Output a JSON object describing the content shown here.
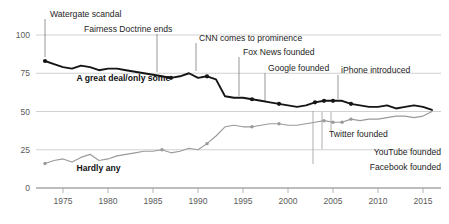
{
  "chart_data": {
    "type": "line",
    "title": "",
    "subtitle": "",
    "xlabel": "",
    "ylabel": "",
    "xlim": [
      1972,
      2017
    ],
    "ylim": [
      0,
      108
    ],
    "grid": true,
    "grid_axis": "y",
    "legend": "inline-series-labels",
    "yticks": [
      0,
      25,
      50,
      75,
      100
    ],
    "xticks": [
      1975,
      1980,
      1985,
      1990,
      1995,
      2000,
      2005,
      2010,
      2015
    ],
    "colors": {
      "series_1": "#151515",
      "series_2": "#9a9a9a",
      "grid": "#bdbdbd",
      "axis": "#6d6d6d",
      "text": "#1d1d1d"
    },
    "series": [
      {
        "name": "A great deal/only some",
        "color": "#151515",
        "label_x": 1976.5,
        "label_y": 70,
        "x": [
          1973,
          1974,
          1975,
          1976,
          1977,
          1978,
          1979,
          1980,
          1981,
          1982,
          1983,
          1984,
          1985,
          1986,
          1987,
          1988,
          1989,
          1990,
          1991,
          1992,
          1993,
          1994,
          1995,
          1996,
          1997,
          1998,
          1999,
          2000,
          2001,
          2002,
          2003,
          2004,
          2005,
          2006,
          2007,
          2008,
          2009,
          2010,
          2011,
          2012,
          2013,
          2014,
          2015,
          2016
        ],
        "values": [
          83,
          81,
          79,
          78,
          80,
          79,
          77,
          78,
          78,
          77,
          76,
          75,
          74,
          73,
          72,
          73,
          75,
          72,
          73,
          71,
          60,
          59,
          59,
          58,
          57,
          56,
          55,
          54,
          53,
          54,
          56,
          57,
          57,
          57,
          55,
          54,
          53,
          53,
          54,
          52,
          53,
          54,
          53,
          51
        ],
        "markers": [
          {
            "x": 1973,
            "y": 83
          },
          {
            "x": 1987,
            "y": 72
          },
          {
            "x": 1991,
            "y": 73
          },
          {
            "x": 1996,
            "y": 58
          },
          {
            "x": 1999,
            "y": 55
          },
          {
            "x": 2003,
            "y": 56
          },
          {
            "x": 2004,
            "y": 57
          },
          {
            "x": 2005,
            "y": 57
          },
          {
            "x": 2007,
            "y": 55
          }
        ]
      },
      {
        "name": "Hardly any",
        "color": "#9a9a9a",
        "label_x": 1976.5,
        "label_y": 11,
        "x": [
          1973,
          1974,
          1975,
          1976,
          1977,
          1978,
          1979,
          1980,
          1981,
          1982,
          1983,
          1984,
          1985,
          1986,
          1987,
          1988,
          1989,
          1990,
          1991,
          1992,
          1993,
          1994,
          1995,
          1996,
          1997,
          1998,
          1999,
          2000,
          2001,
          2002,
          2003,
          2004,
          2005,
          2006,
          2007,
          2008,
          2009,
          2010,
          2011,
          2012,
          2013,
          2014,
          2015,
          2016
        ],
        "values": [
          16,
          18,
          19,
          17,
          20,
          22,
          18,
          19,
          21,
          22,
          23,
          24,
          24,
          25,
          23,
          24,
          26,
          25,
          29,
          34,
          40,
          41,
          40,
          40,
          41,
          42,
          42,
          41,
          41,
          42,
          43,
          44,
          43,
          43,
          45,
          44,
          45,
          45,
          46,
          47,
          47,
          46,
          47,
          50
        ],
        "markers": [
          {
            "x": 1973,
            "y": 16
          },
          {
            "x": 1986,
            "y": 25
          },
          {
            "x": 1991,
            "y": 29
          },
          {
            "x": 1996,
            "y": 40
          },
          {
            "x": 1999,
            "y": 42
          },
          {
            "x": 2004,
            "y": 44
          },
          {
            "x": 2005,
            "y": 43
          },
          {
            "x": 2006,
            "y": 43
          },
          {
            "x": 2007,
            "y": 45
          }
        ]
      }
    ],
    "annotations": [
      {
        "label": "Watergate scandal",
        "x": 1973,
        "y": 83,
        "text_x": 50,
        "text_y": 17,
        "line_x": 45,
        "line_y1": 19,
        "line_y2": 57,
        "anchor": "start",
        "tone": "dark"
      },
      {
        "label": "Fairness Doctrine ends",
        "x": 1987,
        "y": 72,
        "text_x": 84,
        "text_y": 32,
        "line_x": 157,
        "line_y1": 34,
        "line_y2": 72,
        "anchor": "start",
        "tone": "dark"
      },
      {
        "label": "CNN comes to prominence",
        "x": 1991,
        "y": 73,
        "text_x": 199,
        "text_y": 41,
        "line_x": 196,
        "line_y1": 43,
        "line_y2": 71,
        "anchor": "start",
        "tone": "dark"
      },
      {
        "label": "Fox News founded",
        "x": 1996,
        "y": 58,
        "text_x": 243,
        "text_y": 55,
        "line_x": 239,
        "line_y1": 57,
        "line_y2": 96,
        "anchor": "start",
        "tone": "dark"
      },
      {
        "label": "Google founded",
        "x": 1999,
        "y": 55,
        "text_x": 268,
        "text_y": 71,
        "line_x": 265,
        "line_y1": 73,
        "line_y2": 101,
        "anchor": "start",
        "tone": "dark"
      },
      {
        "label": "iPhone introduced",
        "x": 2007,
        "y": 55,
        "text_x": 341,
        "text_y": 73,
        "line_x": 338,
        "line_y1": 75,
        "line_y2": 99,
        "anchor": "start",
        "tone": "dark"
      },
      {
        "label": "Twitter founded",
        "x": 2006,
        "y": 43,
        "text_x": 329,
        "text_y": 137,
        "line_x": 331,
        "line_y1": 112,
        "line_y2": 131,
        "anchor": "start",
        "tone": "light"
      },
      {
        "label": "YouTube founded",
        "x": 2005,
        "y": 43,
        "text_x": 441,
        "text_y": 155,
        "line_x": 322,
        "line_y1": 112,
        "line_y2": 149,
        "anchor": "end",
        "tone": "light"
      },
      {
        "label": "Facebook founded",
        "x": 2004,
        "y": 44,
        "text_x": 441,
        "text_y": 170,
        "line_x": 313,
        "line_y1": 111,
        "line_y2": 164,
        "anchor": "end",
        "tone": "light"
      }
    ]
  }
}
